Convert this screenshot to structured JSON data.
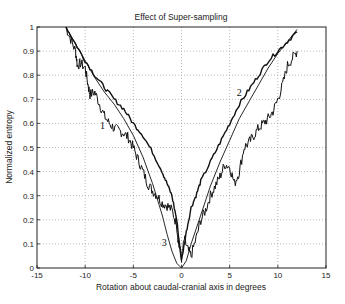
{
  "chart_data": {
    "type": "line",
    "title": "Effect of Super-sampling",
    "xlabel": "Rotation about caudal-cranial axis in degrees",
    "ylabel": "Normalized entropy",
    "xlim": [
      -15,
      15
    ],
    "ylim": [
      0,
      1
    ],
    "xticks": [
      -15,
      -10,
      -5,
      0,
      5,
      10,
      15
    ],
    "yticks": [
      0,
      0.1,
      0.2,
      0.3,
      0.4,
      0.5,
      0.6,
      0.7,
      0.8,
      0.9,
      1
    ],
    "xtick_labels": [
      "-15",
      "-10",
      "-5",
      "0",
      "5",
      "10",
      "15"
    ],
    "ytick_labels": [
      "0",
      "0.1",
      "0.2",
      "0.3",
      "0.4",
      "0.5",
      "0.6",
      "0.7",
      "0.8",
      "0.9",
      "1"
    ],
    "grid": true,
    "legend": null,
    "annotations": [
      {
        "text": "1",
        "x": -8.2,
        "y": 0.575
      },
      {
        "text": "2",
        "x": 6.0,
        "y": 0.715
      },
      {
        "text": "3",
        "x": -1.8,
        "y": 0.09
      }
    ],
    "series": [
      {
        "name": "1",
        "x": [
          -12,
          -11.5,
          -11,
          -10.8,
          -10.5,
          -10,
          -9.7,
          -9.5,
          -9,
          -8.5,
          -8,
          -7.5,
          -7,
          -6.5,
          -6,
          -5.5,
          -5,
          -4.5,
          -4,
          -3.5,
          -3,
          -2.5,
          -2,
          -1.5,
          -1,
          -0.5,
          -0.3,
          0,
          0.3,
          0.6,
          1,
          1.5,
          2,
          2.5,
          3,
          3.5,
          4,
          4.5,
          5,
          5.5,
          6,
          6.5,
          7,
          7.5,
          8,
          8.5,
          9,
          9.5,
          10,
          10.5,
          11,
          11.5,
          12
        ],
        "y": [
          1.0,
          0.95,
          0.9,
          0.84,
          0.85,
          0.83,
          0.76,
          0.72,
          0.73,
          0.68,
          0.63,
          0.6,
          0.58,
          0.57,
          0.56,
          0.54,
          0.5,
          0.45,
          0.4,
          0.35,
          0.32,
          0.3,
          0.27,
          0.26,
          0.24,
          0.18,
          0.1,
          0.04,
          0.12,
          0.08,
          0.05,
          0.12,
          0.2,
          0.24,
          0.3,
          0.34,
          0.38,
          0.43,
          0.42,
          0.35,
          0.4,
          0.5,
          0.52,
          0.55,
          0.58,
          0.6,
          0.62,
          0.65,
          0.7,
          0.76,
          0.84,
          0.87,
          0.9
        ]
      },
      {
        "name": "2",
        "x": [
          -12,
          -11,
          -10,
          -9,
          -8,
          -7,
          -6,
          -5,
          -4,
          -3,
          -2,
          -1.5,
          -1,
          -0.5,
          0,
          0.5,
          1,
          1.5,
          2,
          3,
          4,
          5,
          6,
          7,
          8,
          9,
          10,
          11,
          12
        ],
        "y": [
          1.0,
          0.93,
          0.86,
          0.8,
          0.75,
          0.7,
          0.66,
          0.6,
          0.55,
          0.48,
          0.4,
          0.35,
          0.3,
          0.2,
          0.03,
          0.15,
          0.25,
          0.3,
          0.36,
          0.44,
          0.52,
          0.6,
          0.68,
          0.74,
          0.8,
          0.86,
          0.9,
          0.94,
          0.98
        ]
      },
      {
        "name": "3",
        "x": [
          -12,
          -11,
          -10,
          -9,
          -8,
          -7,
          -6,
          -5,
          -4,
          -3,
          -2,
          -1.5,
          -1,
          -0.5,
          0,
          0.5,
          1,
          2,
          3,
          4,
          5,
          6,
          7,
          8,
          9,
          10,
          11,
          12
        ],
        "y": [
          1.0,
          0.93,
          0.86,
          0.79,
          0.73,
          0.68,
          0.62,
          0.55,
          0.46,
          0.35,
          0.22,
          0.14,
          0.07,
          0.02,
          0.0,
          0.03,
          0.1,
          0.22,
          0.34,
          0.44,
          0.53,
          0.62,
          0.69,
          0.76,
          0.83,
          0.89,
          0.94,
          0.99
        ]
      }
    ]
  }
}
